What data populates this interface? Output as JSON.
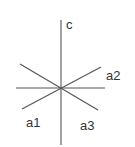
{
  "diagram": {
    "type": "crystallographic-axes",
    "line_color": "#555555",
    "label_color": "#333333",
    "center": [
      61,
      88
    ],
    "axes": [
      {
        "id": "c",
        "label": "c",
        "x1": 61,
        "y1": 20,
        "x2": 61,
        "y2": 145,
        "label_x": 66,
        "label_y": 29
      },
      {
        "id": "horizontal",
        "label": "",
        "x1": 16,
        "y1": 88,
        "x2": 105,
        "y2": 88
      },
      {
        "id": "a1-a2",
        "label": "a2",
        "x1": 22,
        "y1": 109,
        "x2": 101,
        "y2": 67,
        "label_x": 106,
        "label_y": 80
      },
      {
        "id": "a3",
        "label": "",
        "x1": 20,
        "y1": 64,
        "x2": 98,
        "y2": 110
      }
    ],
    "labels": {
      "c": "c",
      "a1": "a1",
      "a2": "a2",
      "a3": "a3"
    }
  }
}
